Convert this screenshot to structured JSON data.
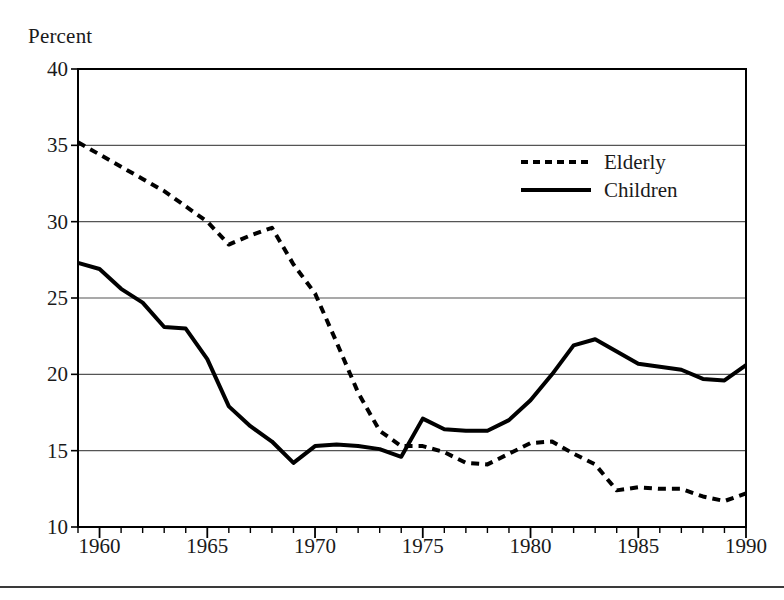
{
  "axis_unit_label": "Percent",
  "legend": {
    "position": "inside-top-right",
    "entries": [
      {
        "label": "Elderly",
        "style": "dashed",
        "color": "#000000",
        "icon": "dashed-line-swatch"
      },
      {
        "label": "Children",
        "style": "solid",
        "color": "#000000",
        "icon": "solid-line-swatch"
      }
    ]
  },
  "chart_data": {
    "type": "line",
    "title": "",
    "subtitle": "",
    "xlabel": "",
    "ylabel": "Percent",
    "xlim": [
      1959,
      1990
    ],
    "ylim": [
      10,
      40
    ],
    "grid": true,
    "grid_axis": "y",
    "x_major_ticks": [
      1960,
      1965,
      1970,
      1975,
      1980,
      1985,
      1990
    ],
    "x_minor_tick_step": 1,
    "y_ticks": [
      10,
      15,
      20,
      25,
      30,
      35,
      40
    ],
    "xtick_labels": [
      "1960",
      "1965",
      "1970",
      "1975",
      "1980",
      "1985",
      "1990"
    ],
    "ytick_labels": [
      "10",
      "15",
      "20",
      "25",
      "30",
      "35",
      "40"
    ],
    "x": [
      1959,
      1960,
      1961,
      1962,
      1963,
      1964,
      1965,
      1966,
      1967,
      1968,
      1969,
      1970,
      1971,
      1972,
      1973,
      1974,
      1975,
      1976,
      1977,
      1978,
      1979,
      1980,
      1981,
      1982,
      1983,
      1984,
      1985,
      1986,
      1987,
      1988,
      1989,
      1990
    ],
    "series": [
      {
        "name": "Elderly",
        "style": "dashed",
        "color": "#000000",
        "values": [
          35.2,
          34.4,
          33.6,
          32.8,
          32.0,
          31.0,
          30.0,
          28.5,
          29.1,
          29.6,
          27.2,
          25.3,
          22.1,
          18.8,
          16.3,
          15.3,
          15.3,
          14.9,
          14.2,
          14.1,
          14.8,
          15.5,
          15.6,
          14.8,
          14.1,
          12.4,
          12.6,
          12.5,
          12.5,
          12.0,
          11.7,
          12.2
        ]
      },
      {
        "name": "Children",
        "style": "solid",
        "color": "#000000",
        "values": [
          27.3,
          26.9,
          25.6,
          24.7,
          23.1,
          23.0,
          21.0,
          17.9,
          16.6,
          15.6,
          14.2,
          15.3,
          15.4,
          15.3,
          15.1,
          14.6,
          17.1,
          16.4,
          16.3,
          16.3,
          17.0,
          18.3,
          20.0,
          21.9,
          22.3,
          21.5,
          20.7,
          20.5,
          20.3,
          19.7,
          19.6,
          20.6
        ]
      }
    ]
  }
}
